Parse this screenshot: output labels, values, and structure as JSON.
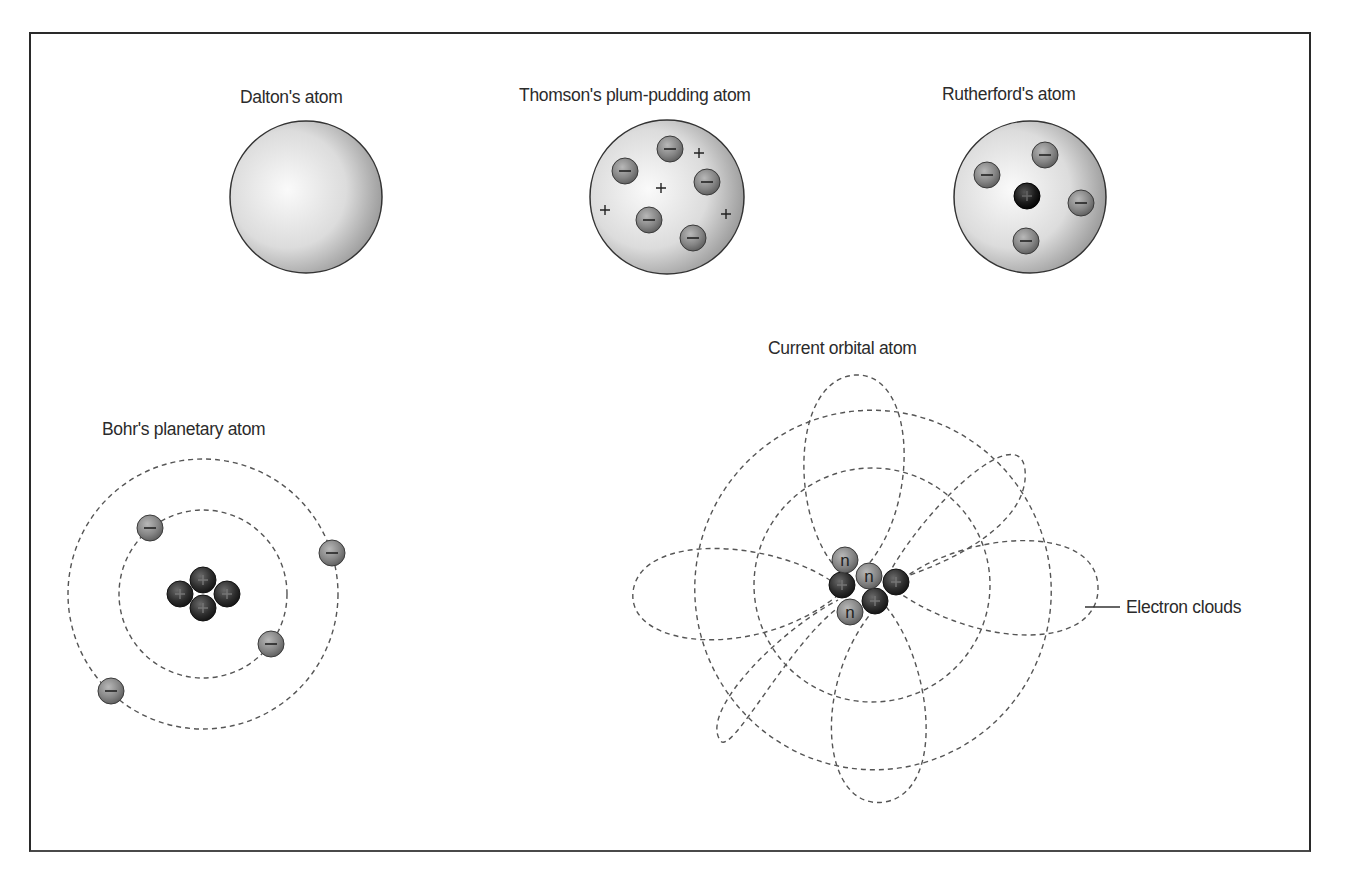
{
  "figure": {
    "models": [
      {
        "id": "dalton",
        "label": "Dalton's atom"
      },
      {
        "id": "thomson",
        "label": "Thomson's plum-pudding atom",
        "electrons": 6,
        "positive_charges": 4
      },
      {
        "id": "rutherford",
        "label": "Rutherford's atom",
        "electrons": 4,
        "nucleus": "+"
      },
      {
        "id": "bohr",
        "label": "Bohr's planetary atom",
        "electrons": 4,
        "orbits": 2,
        "nucleus_protons": 4
      },
      {
        "id": "orbital",
        "label": "Current orbital atom",
        "nucleus": [
          "n",
          "+",
          "n",
          "+",
          "+",
          "n"
        ],
        "callout": "Electron clouds"
      }
    ],
    "symbols": {
      "electron": "−",
      "proton": "+",
      "neutron": "n"
    },
    "colors": {
      "frame": "#2a2a2a",
      "text": "#2b2b2b",
      "orbit": "#555555",
      "electron": "#8a8a8a",
      "proton": "#2a2a2a",
      "sphere_light": "#f2f2f2",
      "sphere_dark": "#8c8c8c"
    }
  }
}
